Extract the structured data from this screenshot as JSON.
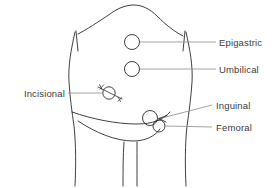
{
  "figure": {
    "line_color": "#2b2b2b",
    "leader_color": "#8c8c8c",
    "text_color": "#3c3c3c",
    "background": "#ffffff"
  },
  "labels": {
    "epigastric": "Epigastric",
    "umbilical": "Umbilical",
    "incisional": "Incisional",
    "inguinal": "Inguinal",
    "femoral": "Femoral"
  },
  "sites": [
    {
      "id": "epigastric",
      "label": "Epigastric",
      "side": "right",
      "marker": "circle"
    },
    {
      "id": "umbilical",
      "label": "Umbilical",
      "side": "right",
      "marker": "circle"
    },
    {
      "id": "incisional",
      "label": "Incisional",
      "side": "left",
      "marker": "circle-with-scar"
    },
    {
      "id": "inguinal",
      "label": "Inguinal",
      "side": "right",
      "marker": "circle-with-arrow"
    },
    {
      "id": "femoral",
      "label": "Femoral",
      "side": "right",
      "marker": "circle"
    }
  ]
}
